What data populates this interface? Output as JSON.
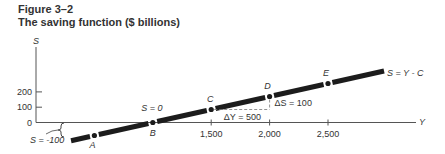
{
  "figure": {
    "number": "Figure 3–2",
    "title": "The saving function ($ billions)"
  },
  "chart_data": {
    "type": "line",
    "title": "The saving function ($ billions)",
    "xlabel": "Y",
    "ylabel": "S",
    "xticks": [
      1500,
      2000,
      2500
    ],
    "xtick_labels": [
      "1,500",
      "2,000",
      "2,500"
    ],
    "yticks": [
      0,
      100,
      200
    ],
    "ytick_labels": [
      "0",
      "100",
      "200"
    ],
    "series": [
      {
        "name": "S = Y - C",
        "points": [
          {
            "label": "A",
            "x": 500,
            "y": -100
          },
          {
            "label": "B",
            "x": 1000,
            "y": 0
          },
          {
            "label": "C",
            "x": 1500,
            "y": 100
          },
          {
            "label": "D",
            "x": 2000,
            "y": 200
          },
          {
            "label": "E",
            "x": 2500,
            "y": 300
          }
        ],
        "line_start": {
          "x": 300,
          "y": -140
        },
        "line_end": {
          "x": 2980,
          "y": 396
        }
      }
    ],
    "annotations": [
      {
        "text": "S = -100",
        "target": "A",
        "type": "brace"
      },
      {
        "text": "S = 0",
        "target": "B"
      },
      {
        "text": "ΔY = 500",
        "between": [
          "C",
          "D"
        ],
        "type": "dashed-horizontal"
      },
      {
        "text": "ΔS = 100",
        "between": [
          "C",
          "D"
        ],
        "type": "dashed-vertical"
      },
      {
        "text": "S = Y - C",
        "type": "line-label"
      }
    ],
    "grid": false,
    "legend": "none"
  }
}
